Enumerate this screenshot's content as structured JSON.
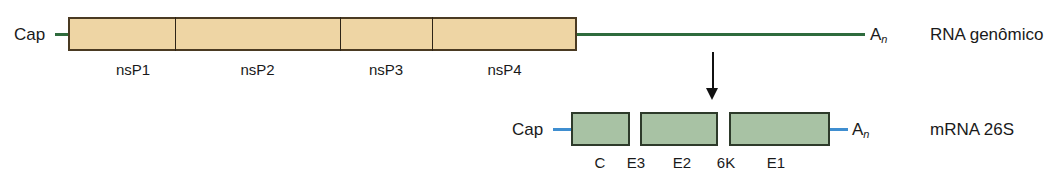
{
  "figure": {
    "background_color": "#ffffff"
  },
  "genomic": {
    "row_label": "RNA genômico",
    "cap_label": "Cap",
    "poly_a_label": "A",
    "poly_a_subscript": "n",
    "orf_fill_color": "#eed5a4",
    "orf_border_color": "#4a3a22",
    "tail_color": "#2f6b3d",
    "segments": [
      {
        "label": "nsP1"
      },
      {
        "label": "nsP2"
      },
      {
        "label": "nsP3"
      },
      {
        "label": "nsP4"
      }
    ]
  },
  "mrna": {
    "row_label": "mRNA 26S",
    "cap_label": "Cap",
    "poly_a_label": "A",
    "poly_a_subscript": "n",
    "box_fill_color": "#a8c2a4",
    "box_border_color": "#2d3a2a",
    "cap_line_color": "#3f8ed0",
    "segments": [
      {
        "label": "C"
      },
      {
        "label": "E3"
      },
      {
        "label": "E2"
      },
      {
        "label": "6K"
      },
      {
        "label": "E1"
      }
    ]
  },
  "arrow": {
    "color": "#111111",
    "direction": "down"
  }
}
